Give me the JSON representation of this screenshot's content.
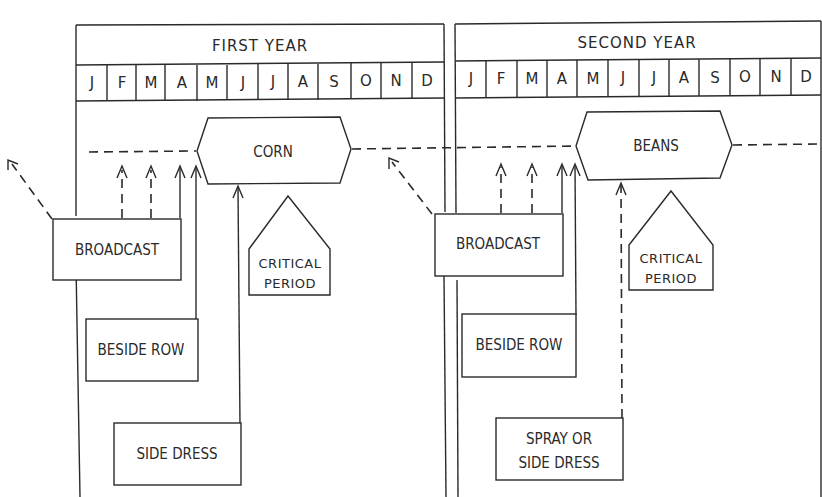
{
  "years": [
    {
      "title": "FIRST YEAR",
      "crop": "CORN"
    },
    {
      "title": "SECOND YEAR",
      "crop": "BEANS"
    }
  ],
  "months": [
    "J",
    "F",
    "M",
    "A",
    "M",
    "J",
    "J",
    "A",
    "S",
    "O",
    "N",
    "D"
  ],
  "first_year": {
    "title": "FIRST YEAR",
    "crop": "CORN",
    "broadcast": "BROADCAST",
    "beside_row": "BESIDE ROW",
    "side_dress": "SIDE DRESS",
    "critical_1": "CRITICAL",
    "critical_2": "PERIOD"
  },
  "second_year": {
    "title": "SECOND YEAR",
    "crop": "BEANS",
    "broadcast": "BROADCAST",
    "beside_row": "BESIDE ROW",
    "spray_1": "SPRAY OR",
    "spray_2": "SIDE DRESS",
    "critical_1": "CRITICAL",
    "critical_2": "PERIOD"
  },
  "m": {
    "y1": [
      "J",
      "F",
      "M",
      "A",
      "M",
      "J",
      "J",
      "A",
      "S",
      "O",
      "N",
      "D"
    ],
    "y2": [
      "J",
      "F",
      "M",
      "A",
      "M",
      "J",
      "J",
      "A",
      "S",
      "O",
      "N",
      "D"
    ]
  }
}
